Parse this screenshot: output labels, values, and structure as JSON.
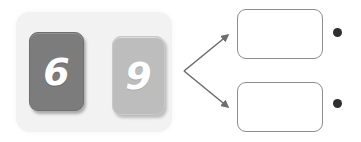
{
  "diagram": {
    "background_color": "#ffffff"
  },
  "key_panel": {
    "name": "keyboard-panel",
    "background_color": "#f2f2f2",
    "keys": [
      {
        "id": "six",
        "label": "6",
        "fill_color": "#7c7c7c",
        "label_color": "#ffffff",
        "state": "pressed-dark"
      },
      {
        "id": "nine",
        "label": "9",
        "fill_color": "#bdbdbd",
        "label_color": "#ffffff",
        "state": "normal-light"
      }
    ]
  },
  "arrows": {
    "stroke_color": "#6e6e6e",
    "origin_label": "",
    "items": [
      {
        "id": "arrow-to-top",
        "direction": "up-right",
        "target": "box-top"
      },
      {
        "id": "arrow-to-bottom",
        "direction": "down-right",
        "target": "box-bottom"
      }
    ]
  },
  "boxes": [
    {
      "id": "box-top",
      "content": "",
      "border_color": "#8d8d8d",
      "fill_color": "#ffffff"
    },
    {
      "id": "box-bottom",
      "content": "",
      "border_color": "#8d8d8d",
      "fill_color": "#ffffff"
    }
  ],
  "bullets": [
    {
      "id": "dot-top",
      "content": "",
      "color": "#2e2e2e"
    },
    {
      "id": "dot-bottom",
      "content": "",
      "color": "#2e2e2e"
    }
  ]
}
